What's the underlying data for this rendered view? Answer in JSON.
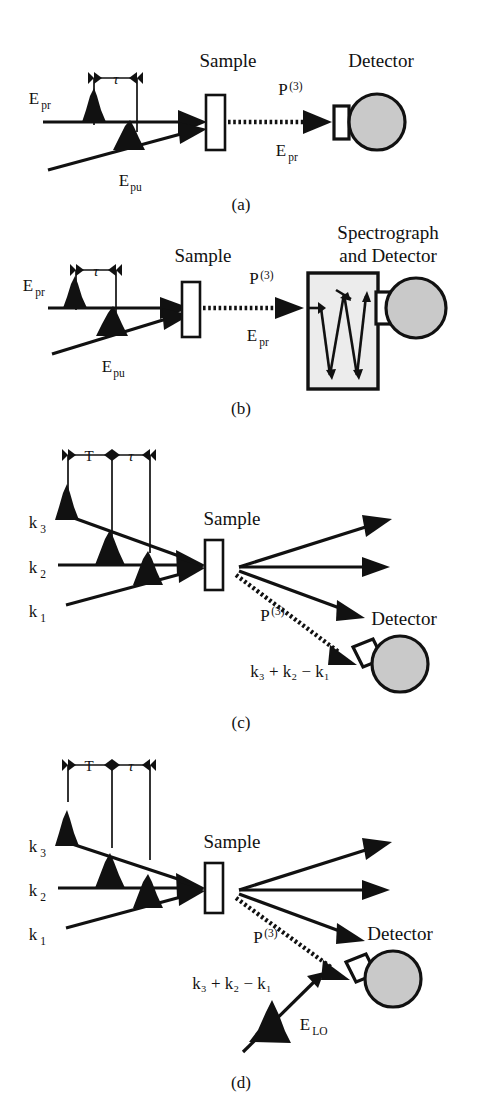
{
  "figure": {
    "type": "scientific-schematic",
    "background_color": "#ffffff",
    "ink_color": "#111111",
    "detector_fill": "#c9c9c9",
    "spectrograph_fill": "#ececec"
  },
  "panels": [
    {
      "id": "a",
      "caption": "(a)",
      "title": "pump-probe geometry with direct detector",
      "timing": {
        "interval_label": "τ"
      },
      "labels": {
        "probe": "E",
        "probe_sub": "pr",
        "pump": "E",
        "pump_sub": "pu",
        "sample": "Sample",
        "polarization": "P",
        "polarization_sup": "(3)",
        "signal": "E",
        "signal_sub": "pr",
        "detector": "Detector"
      },
      "pulses": 2,
      "beams_in": 2,
      "beams_out": 1
    },
    {
      "id": "b",
      "caption": "(b)",
      "title": "pump-probe geometry with spectrograph and detector",
      "timing": {
        "interval_label": "τ"
      },
      "labels": {
        "probe": "E",
        "probe_sub": "pr",
        "pump": "E",
        "pump_sub": "pu",
        "sample": "Sample",
        "polarization": "P",
        "polarization_sup": "(3)",
        "signal": "E",
        "signal_sub": "pr",
        "detector_line1": "Spectrograph",
        "detector_line2": "and Detector"
      },
      "pulses": 2,
      "beams_in": 2,
      "beams_out": 1
    },
    {
      "id": "c",
      "caption": "(c)",
      "title": "three-pulse photon echo box geometry, homodyne detection",
      "timing": {
        "interval_label_1": "T",
        "interval_label_2": "τ"
      },
      "labels": {
        "k3": "k",
        "k3_sub": "3",
        "k2": "k",
        "k2_sub": "2",
        "k1": "k",
        "k1_sub": "1",
        "sample": "Sample",
        "polarization": "P",
        "polarization_sup": "(3)",
        "phase_match": "k₃ + k₂ − k₁",
        "detector": "Detector"
      },
      "pulses": 3,
      "beams_in": 3,
      "beams_out": 3
    },
    {
      "id": "d",
      "caption": "(d)",
      "title": "three-pulse photon echo with local oscillator heterodyne detection",
      "timing": {
        "interval_label_1": "T",
        "interval_label_2": "τ"
      },
      "labels": {
        "k3": "k",
        "k3_sub": "3",
        "k2": "k",
        "k2_sub": "2",
        "k1": "k",
        "k1_sub": "1",
        "sample": "Sample",
        "polarization": "P",
        "polarization_sup": "(3)",
        "phase_match": "k₃ + k₂ − k₁",
        "local_oscillator": "E",
        "local_oscillator_sub": "LO",
        "detector": "Detector"
      },
      "pulses": 3,
      "beams_in": 3,
      "beams_out": 3,
      "has_local_oscillator": true
    }
  ]
}
